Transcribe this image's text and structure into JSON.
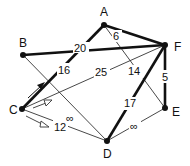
{
  "nodes": {
    "A": {
      "label": "A",
      "x": 104,
      "y": 25
    },
    "B": {
      "label": "B",
      "x": 23,
      "y": 55
    },
    "C": {
      "label": "C",
      "x": 22,
      "y": 109
    },
    "D": {
      "label": "D",
      "x": 107,
      "y": 141
    },
    "E": {
      "label": "E",
      "x": 165,
      "y": 108
    },
    "F": {
      "label": "F",
      "x": 165,
      "y": 45
    }
  },
  "edges": [
    {
      "from": "A",
      "to": "F",
      "weight": "6",
      "bold": true
    },
    {
      "from": "B",
      "to": "F",
      "weight": "20",
      "bold": true
    },
    {
      "from": "C",
      "to": "A",
      "weight": "16",
      "bold": true
    },
    {
      "from": "C",
      "to": "F",
      "weight": "25",
      "bold": false
    },
    {
      "from": "A",
      "to": "E",
      "weight": "14",
      "bold": false
    },
    {
      "from": "F",
      "to": "E",
      "weight": "5",
      "bold": true
    },
    {
      "from": "F",
      "to": "D",
      "weight": "17",
      "bold": true
    },
    {
      "from": "B",
      "to": "D",
      "weight": "∞",
      "bold": false
    },
    {
      "from": "C",
      "to": "D",
      "weight": "12",
      "bold": false
    },
    {
      "from": "D",
      "to": "E",
      "weight": "∞",
      "bold": false
    }
  ],
  "labels": {
    "A": "A",
    "B": "B",
    "C": "C",
    "D": "D",
    "E": "E",
    "F": "F",
    "w_AF": "6",
    "w_BF": "20",
    "w_CA": "16",
    "w_CF": "25",
    "w_AE": "14",
    "w_FE": "5",
    "w_FD": "17",
    "w_BD": "∞",
    "w_CD": "12",
    "w_DE": "∞"
  }
}
